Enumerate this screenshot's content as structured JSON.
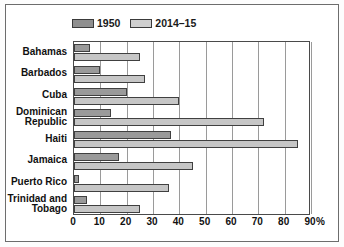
{
  "chart_data": {
    "type": "bar",
    "orientation": "horizontal",
    "title": "",
    "xlabel": "%",
    "ylabel": "",
    "xlim": [
      0,
      90
    ],
    "xticks": [
      0,
      10,
      20,
      30,
      40,
      50,
      60,
      70,
      80,
      90
    ],
    "grid": true,
    "legend_position": "top-left",
    "categories": [
      "Bahamas",
      "Barbados",
      "Cuba",
      "Dominican Republic",
      "Haiti",
      "Jamaica",
      "Puerto Rico",
      "Trinidad and Tobago"
    ],
    "series": [
      {
        "name": "1950",
        "color": "#9a9a9a",
        "values": [
          6,
          10,
          20,
          14,
          37,
          17,
          2,
          5
        ]
      },
      {
        "name": "2014–15",
        "color": "#c6c6c6",
        "values": [
          25,
          27,
          40,
          72,
          85,
          45,
          36,
          25
        ]
      }
    ]
  },
  "axis": {
    "unit_label": "%",
    "tick_labels": [
      "0",
      "10",
      "20",
      "30",
      "40",
      "50",
      "60",
      "70",
      "80",
      "90"
    ]
  },
  "category_labels": [
    [
      "Bahamas"
    ],
    [
      "Barbados"
    ],
    [
      "Cuba"
    ],
    [
      "Dominican",
      "Republic"
    ],
    [
      "Haiti"
    ],
    [
      "Jamaica"
    ],
    [
      "Puerto Rico"
    ],
    [
      "Trinidad and",
      "Tobago"
    ]
  ],
  "legend": {
    "entries": [
      {
        "label": "1950",
        "swatch_class": "s1950"
      },
      {
        "label": "2014–15",
        "swatch_class": "s201415"
      }
    ]
  }
}
